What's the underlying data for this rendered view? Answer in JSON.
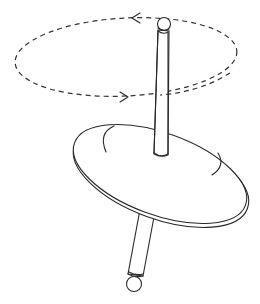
{
  "figure": {
    "components": [
      {
        "name": "precession-path",
        "style": "dashed ellipse",
        "direction": "counterclockwise (viewed from above)"
      },
      {
        "name": "top-ball",
        "shape": "sphere"
      },
      {
        "name": "upper-rod",
        "shape": "cylinder"
      },
      {
        "name": "disc",
        "shape": "flat tilted disc with rotation marks"
      },
      {
        "name": "lower-rod",
        "shape": "cylinder"
      },
      {
        "name": "bottom-ball",
        "shape": "sphere"
      }
    ],
    "colors": {
      "line": "#2a2a2a",
      "background": "#ffffff"
    }
  }
}
